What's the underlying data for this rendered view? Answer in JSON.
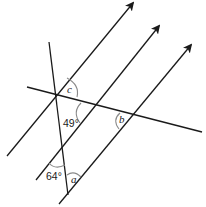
{
  "diagram": {
    "type": "geometry-parallel-lines",
    "parallel_lines": [
      {
        "id": "p1",
        "from": [
          7,
          156
        ],
        "to": [
          133,
          2
        ],
        "arrow": true
      },
      {
        "id": "p2",
        "from": [
          36,
          180
        ],
        "to": [
          159,
          25
        ],
        "arrow": true
      },
      {
        "id": "p3",
        "from": [
          59,
          204
        ],
        "to": [
          191,
          44
        ],
        "arrow": true
      }
    ],
    "transversals": [
      {
        "id": "t1",
        "from": [
          49,
          42
        ],
        "to": [
          68,
          195
        ]
      },
      {
        "id": "t2",
        "from": [
          27,
          87
        ],
        "to": [
          202,
          132
        ]
      }
    ],
    "angles": [
      {
        "id": "c",
        "label": "c",
        "position": [
          71,
          91
        ]
      },
      {
        "id": "49",
        "label": "49°",
        "position": [
          64,
          126
        ]
      },
      {
        "id": "b",
        "label": "b",
        "position": [
          119,
          121
        ]
      },
      {
        "id": "64",
        "label": "64°",
        "position": [
          47,
          178
        ]
      },
      {
        "id": "a",
        "label": "a",
        "position": [
          71,
          182
        ]
      }
    ]
  }
}
